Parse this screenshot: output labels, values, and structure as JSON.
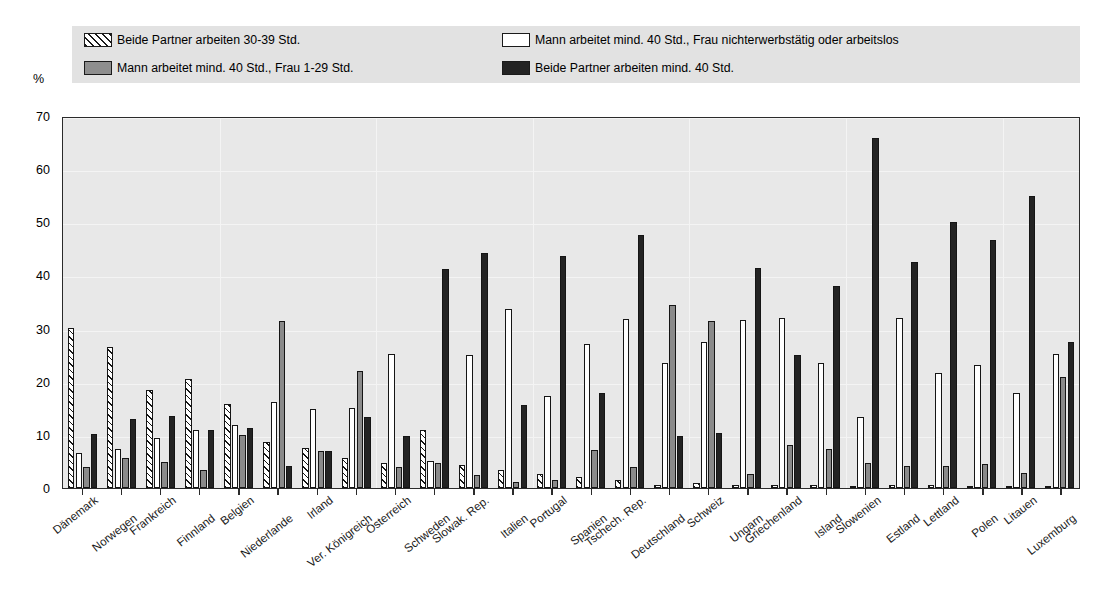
{
  "axis": {
    "unit_label": "%",
    "y_ticks": [
      0,
      10,
      20,
      30,
      40,
      50,
      60,
      70
    ]
  },
  "legend": {
    "items": [
      {
        "swatch": "hatched-swatch",
        "label": "Beide Partner arbeiten 30-39 Std."
      },
      {
        "swatch": "gray-swatch",
        "label": "Mann arbeitet mind. 40 Std., Frau 1-29 Std."
      },
      {
        "swatch": "white-swatch",
        "label": "Mann arbeitet mind. 40 Std., Frau nichterwerbstätig oder arbeitslos"
      },
      {
        "swatch": "black-swatch",
        "label": "Beide Partner arbeiten mind. 40 Std."
      }
    ]
  },
  "chart_data": {
    "type": "bar",
    "title": "",
    "xlabel": "",
    "ylabel": "%",
    "ylim": [
      0,
      70
    ],
    "ytick_step": 10,
    "grid": true,
    "legend_position": "top",
    "categories": [
      "Dänemark",
      "Norwegen",
      "Frankreich",
      "Finnland",
      "Belgien",
      "Niederlande",
      "Irland",
      "Ver. Königreich",
      "Österreich",
      "Schweden",
      "Slowak. Rep.",
      "Italien",
      "Portugal",
      "Spanien",
      "Tschech. Rep.",
      "Deutschland",
      "Schweiz",
      "Ungarn",
      "Griechenland",
      "Island",
      "Slowenien",
      "Estland",
      "Lettland",
      "Polen",
      "Litauen",
      "Luxemburg"
    ],
    "series": [
      {
        "name": "Beide Partner arbeiten 30-39 Std.",
        "style": "hatched",
        "values": [
          30.1,
          26.6,
          18.5,
          20.6,
          15.8,
          8.6,
          7.6,
          5.6,
          4.8,
          11.0,
          4.3,
          3.4,
          2.6,
          2.0,
          1.5,
          0.6,
          0.9,
          0.5,
          0.6,
          0.5,
          0.4,
          0.6,
          0.5,
          0.4,
          0.3,
          0.2
        ]
      },
      {
        "name": "Mann arbeitet mind. 40 Std., Frau nichterwerbstätig oder arbeitslos",
        "style": "white",
        "values": [
          6.5,
          7.3,
          9.5,
          10.9,
          11.8,
          16.2,
          14.9,
          15.0,
          25.2,
          5.0,
          25.1,
          33.7,
          17.3,
          27.1,
          31.8,
          23.5,
          27.5,
          31.7,
          31.9,
          23.6,
          13.3,
          31.9,
          21.6,
          23.2,
          17.8,
          25.3
        ]
      },
      {
        "name": "Mann arbeitet mind. 40 Std., Frau 1-29 Std.",
        "style": "gray",
        "values": [
          4.0,
          5.6,
          4.9,
          3.4,
          9.9,
          31.5,
          7.0,
          22.1,
          4.0,
          4.7,
          2.4,
          1.2,
          1.5,
          7.1,
          3.9,
          34.4,
          31.4,
          2.6,
          8.1,
          7.3,
          4.7,
          4.2,
          4.1,
          4.6,
          2.8,
          20.8
        ]
      },
      {
        "name": "Beide Partner arbeiten mind. 40 Std.",
        "style": "black",
        "values": [
          10.2,
          13.0,
          13.5,
          10.9,
          11.2,
          4.1,
          6.9,
          13.4,
          9.8,
          41.2,
          44.2,
          15.7,
          43.7,
          17.8,
          47.6,
          9.8,
          10.4,
          41.4,
          25.1,
          38.1,
          65.9,
          42.6,
          50.0,
          46.6,
          54.9,
          27.5
        ]
      }
    ]
  },
  "colors": {
    "plot_background": "#e8e8e8",
    "legend_background": "#e2e2e2",
    "axis": "#2b2b2b",
    "series_gray": "#8a8a8a",
    "series_black": "#232323",
    "series_white": "#ffffff"
  }
}
